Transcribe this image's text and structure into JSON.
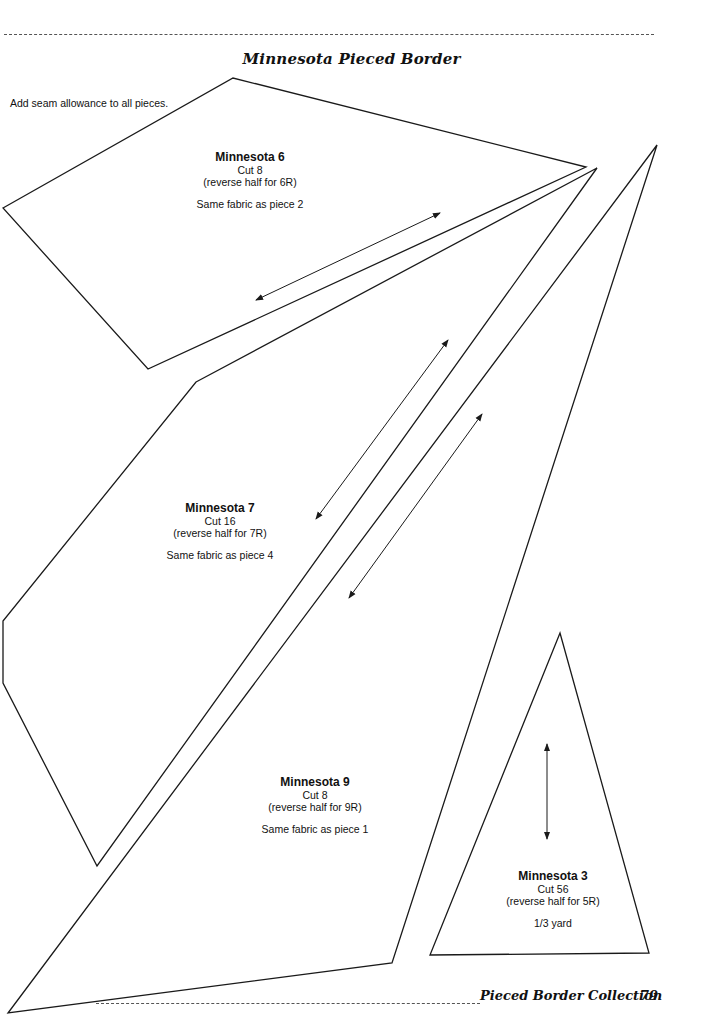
{
  "header": {
    "title": "Minnesota Pieced Border"
  },
  "instructions": "Add seam allowance to all pieces.",
  "pieces": [
    {
      "name": "Minnesota 6",
      "cut": "Cut 8",
      "reverse": "(reverse half for 6R)",
      "fabric": "Same fabric as piece 2"
    },
    {
      "name": "Minnesota 7",
      "cut": "Cut 16",
      "reverse": "(reverse half for 7R)",
      "fabric": "Same fabric as piece 4"
    },
    {
      "name": "Minnesota 9",
      "cut": "Cut 8",
      "reverse": "(reverse half for 9R)",
      "fabric": "Same fabric as piece 1"
    },
    {
      "name": "Minnesota 3",
      "cut": "Cut 56",
      "reverse": "(reverse half for 5R)",
      "fabric": "1/3 yard"
    }
  ],
  "footer": {
    "book_title": "Pieced Border Collection",
    "page_number": "79"
  },
  "colors": {
    "line": "#1a1a1a",
    "background": "#ffffff"
  }
}
